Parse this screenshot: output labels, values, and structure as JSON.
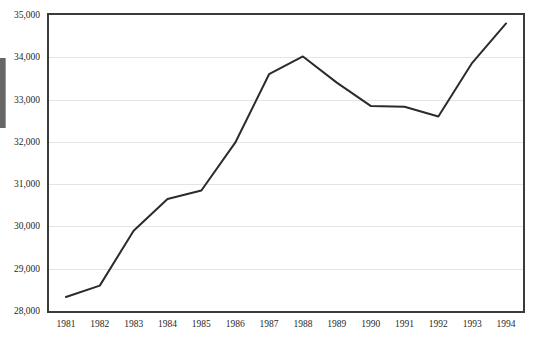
{
  "chart_data": {
    "type": "line",
    "title": "",
    "xlabel": "",
    "ylabel": "",
    "x": [
      1981,
      1982,
      1983,
      1984,
      1985,
      1986,
      1987,
      1988,
      1989,
      1990,
      1991,
      1992,
      1993,
      1994
    ],
    "categories": [
      "1981",
      "1982",
      "1983",
      "1984",
      "1985",
      "1986",
      "1987",
      "1988",
      "1989",
      "1990",
      "1991",
      "1992",
      "1993",
      "1994"
    ],
    "values": [
      28330,
      28600,
      29900,
      30650,
      30850,
      31980,
      33600,
      34020,
      33400,
      32850,
      32830,
      32600,
      33870,
      34800
    ],
    "series": [
      {
        "name": "",
        "values": [
          28330,
          28600,
          29900,
          30650,
          30850,
          31980,
          33600,
          34020,
          33400,
          32850,
          32830,
          32600,
          33870,
          34800
        ]
      }
    ],
    "ylim": [
      28000,
      35000
    ],
    "ytick_values": [
      35000,
      34000,
      33000,
      32000,
      31000,
      30000,
      29000,
      28000
    ],
    "ytick_labels": [
      "35,000",
      "34,000",
      "33,000",
      "32,000",
      "31,000",
      "30,000",
      "29,000",
      "28,000"
    ],
    "xtick_labels": [
      "1981",
      "1982",
      "1983",
      "1984",
      "1985",
      "1986",
      "1987",
      "1988",
      "1989",
      "1990",
      "1991",
      "1992",
      "1993",
      "1994"
    ],
    "grid": true,
    "grid_axis": "y",
    "legend": false,
    "legend_position": "none",
    "line_color": "#2b2b2b",
    "line_width": 2,
    "markers": false,
    "background_color": "#ffffff",
    "border_color": "#3b3b3b",
    "gridline_color": "#e4e4e4"
  },
  "chrome": {
    "scrollbar_thumb_color": "#666666"
  }
}
